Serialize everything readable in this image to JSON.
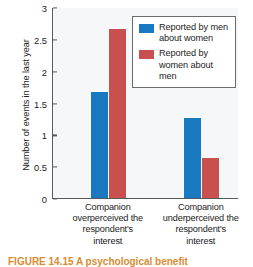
{
  "chart_data": {
    "type": "bar",
    "title": "",
    "xlabel": "",
    "ylabel": "Number of events in the last year",
    "ylim": [
      0,
      3
    ],
    "yticks": [
      0,
      0.5,
      1,
      1.5,
      2,
      2.5,
      3
    ],
    "ytick_labels": [
      "0",
      "0.5",
      "1",
      "1.5",
      "2",
      "2.5",
      "3"
    ],
    "grid": false,
    "legend_position": "top-right",
    "categories": [
      "Companion overperceived the respondent's interest",
      "Companion underperceived the respondent's interest"
    ],
    "series": [
      {
        "name": "Reported by men about women",
        "color": "#1878c0",
        "values": [
          1.67,
          1.25
        ]
      },
      {
        "name": "Reported by women about men",
        "color": "#c8504f",
        "values": [
          2.66,
          0.63
        ]
      }
    ]
  },
  "axes": {
    "y_title": "Number of events in the last year"
  },
  "legend": {
    "entries": [
      {
        "label": "Reported by men about women",
        "color": "#1878c0"
      },
      {
        "label": "Reported by women about men",
        "color": "#c8504f"
      }
    ]
  },
  "x_group_labels": [
    {
      "lines": [
        "Companion",
        "overperceived the",
        "respondent's",
        "interest"
      ]
    },
    {
      "lines": [
        "Companion",
        "underperceived the",
        "respondent's",
        "interest"
      ]
    }
  ],
  "caption": {
    "text": "FIGURE 14.15  A psychological benefit"
  },
  "colors": {
    "blue": "#1878c0",
    "red": "#c8504f",
    "plot_background": "#f5f7f8",
    "axis": "#57595a",
    "text": "#1c1c1c",
    "caption": "#d98b33"
  }
}
